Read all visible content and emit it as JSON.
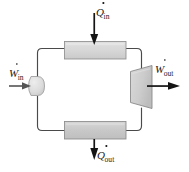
{
  "diagram": {
    "type": "thermodynamic-cycle-block-diagram",
    "background_color": "#ffffff",
    "line_color": "#3a3a3a",
    "arrow_color": "#1a1a1a",
    "labels": {
      "heat_in": {
        "symbol": "Q",
        "subscript": "in",
        "dotted": true,
        "text": "Q̇in"
      },
      "heat_out": {
        "symbol": "Q",
        "subscript": "out",
        "dotted": true,
        "text": "Q̇out"
      },
      "work_in": {
        "symbol": "W",
        "subscript": "in",
        "dotted": true,
        "text": "Ẇin"
      },
      "work_out": {
        "symbol": "W",
        "subscript": "out",
        "dotted": true,
        "text": "Ẇout"
      }
    },
    "components": [
      {
        "name": "boiler",
        "shape": "rectangle",
        "position": "top",
        "fill": "#d6d6d6",
        "stroke": "#8c8c8c"
      },
      {
        "name": "condenser",
        "shape": "rectangle",
        "position": "bottom",
        "fill": "#c9c9c9",
        "stroke": "#8c8c8c"
      },
      {
        "name": "pump",
        "shape": "rounded-d",
        "position": "left",
        "fill": "#dcdcdc",
        "stroke": "#9a9a9a"
      },
      {
        "name": "turbine",
        "shape": "trapezoid",
        "position": "right",
        "fill": "#cfcfcf",
        "stroke": "#8c8c8c"
      }
    ],
    "arrows": [
      {
        "name": "heat-in-arrow",
        "direction": "down",
        "target": "boiler"
      },
      {
        "name": "heat-out-arrow",
        "direction": "down",
        "target": "ambient"
      },
      {
        "name": "work-in-arrow",
        "direction": "right",
        "target": "pump"
      },
      {
        "name": "work-out-arrow",
        "direction": "right",
        "target": "ambient"
      }
    ],
    "flow_loop": "closed clockwise loop connecting pump, boiler, turbine, condenser"
  }
}
